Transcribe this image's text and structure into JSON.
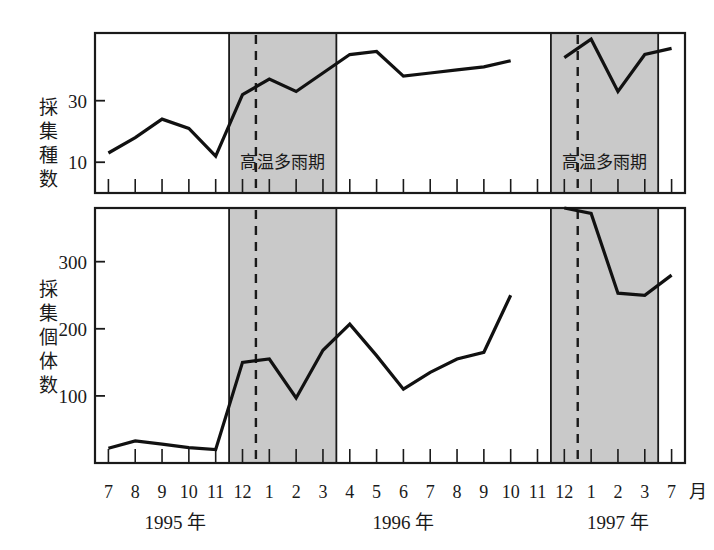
{
  "figure": {
    "background_color": "#ffffff",
    "line_color": "#111111",
    "shade_color": "#c9c9c9",
    "axis_color": "#1a1a1a",
    "month_unit_label": "月"
  },
  "x_axis": {
    "tick_labels": [
      "7",
      "8",
      "9",
      "10",
      "11",
      "12",
      "1",
      "2",
      "3",
      "4",
      "5",
      "6",
      "7",
      "8",
      "9",
      "10",
      "11",
      "12",
      "1",
      "2",
      "3",
      "7"
    ],
    "year_labels": [
      {
        "text": "1995 年",
        "center_index": 2.5
      },
      {
        "text": "1996 年",
        "center_index": 11.0
      },
      {
        "text": "1997 年",
        "center_index": 19.0
      }
    ]
  },
  "bands": [
    {
      "label": "高温多雨期",
      "start_index": 4.5,
      "end_index": 8.5,
      "dash_index": 5.5
    },
    {
      "label": "高温多雨期",
      "start_index": 16.5,
      "end_index": 20.5,
      "dash_index": 17.5
    }
  ],
  "chart_data": [
    {
      "id": "species-count",
      "type": "line",
      "title": "",
      "ylabel": "採集種数",
      "xlabel": "",
      "ytick_values": [
        30,
        10
      ],
      "ytick_labels": [
        "30",
        "10"
      ],
      "ylim": [
        0,
        52
      ],
      "grid": false,
      "legend": "none",
      "x": [
        "7",
        "8",
        "9",
        "10",
        "11",
        "12",
        "1",
        "2",
        "3",
        "4",
        "5",
        "6",
        "7",
        "8",
        "9",
        "10",
        "11",
        "12",
        "1",
        "2",
        "3",
        "7"
      ],
      "values": [
        13,
        18,
        24,
        21,
        12,
        32,
        37,
        33,
        39,
        45,
        46,
        38,
        39,
        40,
        41,
        43,
        null,
        44,
        50,
        33,
        45,
        47
      ]
    },
    {
      "id": "individual-count",
      "type": "line",
      "title": "",
      "ylabel": "採集個体数",
      "xlabel": "",
      "ytick_values": [
        300,
        200,
        100
      ],
      "ytick_labels": [
        "300",
        "200",
        "100"
      ],
      "ylim": [
        0,
        380
      ],
      "grid": false,
      "legend": "none",
      "x": [
        "7",
        "8",
        "9",
        "10",
        "11",
        "12",
        "1",
        "2",
        "3",
        "4",
        "5",
        "6",
        "7",
        "8",
        "9",
        "10",
        "11",
        "12",
        "1",
        "2",
        "3",
        "7"
      ],
      "values": [
        22,
        33,
        28,
        23,
        20,
        150,
        155,
        97,
        168,
        207,
        160,
        110,
        135,
        155,
        165,
        250,
        null,
        380,
        372,
        253,
        250,
        280
      ]
    }
  ],
  "axis_titles": {
    "top": "採集種数",
    "bottom": "採集個体数"
  }
}
